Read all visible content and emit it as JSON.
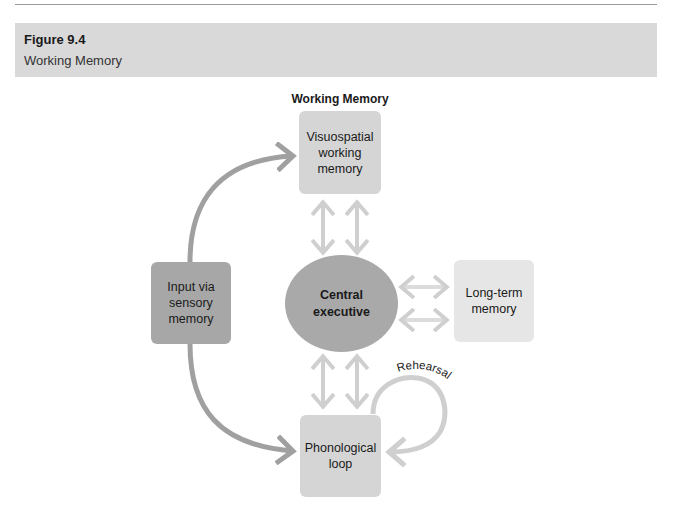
{
  "figure": {
    "number": "Figure 9.4",
    "title": "Working Memory"
  },
  "diagram": {
    "heading": "Working Memory",
    "nodes": {
      "visuospatial": {
        "label": "Visuospatial working memory",
        "lines": [
          "Visuospatial",
          "working",
          "memory"
        ]
      },
      "input": {
        "label": "Input via sensory memory",
        "lines": [
          "Input via",
          "sensory",
          "memory"
        ]
      },
      "central": {
        "label": "Central executive",
        "lines": [
          "Central",
          "executive"
        ]
      },
      "longterm": {
        "label": "Long-term memory",
        "lines": [
          "Long-term",
          "memory"
        ]
      },
      "phonological": {
        "label": "Phonological loop",
        "lines": [
          "Phonological",
          "loop"
        ]
      }
    },
    "edges": [
      {
        "from": "input",
        "to": "visuospatial",
        "type": "curved-arrow"
      },
      {
        "from": "input",
        "to": "phonological",
        "type": "curved-arrow"
      },
      {
        "from": "visuospatial",
        "to": "central",
        "type": "double-arrow",
        "count": 2
      },
      {
        "from": "central",
        "to": "phonological",
        "type": "double-arrow",
        "count": 2
      },
      {
        "from": "central",
        "to": "longterm",
        "type": "double-arrow",
        "count": 2
      },
      {
        "from": "phonological",
        "to": "phonological",
        "type": "loop-arrow",
        "label": "Rehearsal"
      }
    ],
    "rehearsal_label": "Rehearsal",
    "colors": {
      "header_band": "#d9d9d9",
      "box_light": "#d5d5d5",
      "box_dark": "#a7a7a7",
      "box_lighter": "#e6e6e6",
      "arrow_dark": "#a0a0a0",
      "arrow_light": "#cfcfcf"
    }
  }
}
